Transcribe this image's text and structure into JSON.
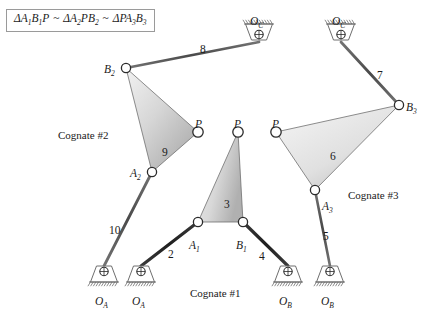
{
  "figure": {
    "formula": {
      "parts": [
        {
          "delta": "Δ",
          "text": "A",
          "sub": "1",
          "text2": "B",
          "sub2": "1",
          "text3": "P"
        },
        {
          "delta": "Δ",
          "text": "A",
          "sub": "2",
          "text2": "P",
          "sub2": "",
          "text3": "B",
          "sub3": "2"
        },
        {
          "delta": "Δ",
          "text": "P",
          "sub": "",
          "text2": "A",
          "sub2": "3",
          "text3": "B",
          "sub3": "3"
        }
      ],
      "similar_symbol": "~",
      "plain": "ΔA1B1P ~ ΔA2PB2 ~ ΔPA3B3"
    },
    "colors": {
      "link_dark": "#2b2b2b",
      "link_mid": "#575757",
      "link_light": "#8c8c8c",
      "coupler_fill_light": "#ededed",
      "coupler_fill_dark": "#b4b4b4",
      "coupler_stroke": "#707070",
      "joint_stroke": "#2b2b2b",
      "joint_fill": "#ffffff",
      "ground_stroke": "#6e6e6e",
      "text": "#1a1a1a",
      "box_border": "#9a9a9a"
    },
    "cognates": [
      {
        "name": "cognate-1",
        "label": "Cognate #1",
        "x": 190,
        "y": 288
      },
      {
        "name": "cognate-2",
        "label": "Cognate #2",
        "x": 58,
        "y": 130
      },
      {
        "name": "cognate-3",
        "label": "Cognate #3",
        "x": 348,
        "y": 190
      }
    ],
    "joints": [
      {
        "name": "A1",
        "base": "A",
        "sub": "1",
        "x": 198,
        "y": 222,
        "lx": 189,
        "ly": 240,
        "r": 4.6
      },
      {
        "name": "B1",
        "base": "B",
        "sub": "1",
        "x": 243,
        "y": 222,
        "lx": 236,
        "ly": 240,
        "r": 4.6
      },
      {
        "name": "P1",
        "base": "P",
        "sub": "",
        "x": 238,
        "y": 132,
        "lx": 234,
        "ly": 119,
        "r": 5.2
      },
      {
        "name": "A2",
        "base": "A",
        "sub": "2",
        "x": 152,
        "y": 172,
        "lx": 130,
        "ly": 168,
        "r": 4.6
      },
      {
        "name": "B2",
        "base": "B",
        "sub": "2",
        "x": 126,
        "y": 68,
        "lx": 104,
        "ly": 64,
        "r": 4.6
      },
      {
        "name": "P2",
        "base": "P",
        "sub": "",
        "x": 198,
        "y": 132,
        "lx": 195,
        "ly": 119,
        "r": 5.2
      },
      {
        "name": "A3",
        "base": "A",
        "sub": "3",
        "x": 315,
        "y": 190,
        "lx": 322,
        "ly": 201,
        "r": 4.6
      },
      {
        "name": "B3",
        "base": "B",
        "sub": "3",
        "x": 399,
        "y": 105,
        "lx": 406,
        "ly": 102,
        "r": 4.6
      },
      {
        "name": "P3",
        "base": "P",
        "sub": "",
        "x": 276,
        "y": 132,
        "lx": 272,
        "ly": 119,
        "r": 5.2
      }
    ],
    "grounds": [
      {
        "name": "OA-left",
        "base": "O",
        "sub": "A",
        "x": 104,
        "y": 266,
        "flip": false,
        "lx": 95,
        "ly": 296
      },
      {
        "name": "OA-right",
        "base": "O",
        "sub": "A",
        "x": 141,
        "y": 266,
        "flip": false,
        "lx": 132,
        "ly": 296
      },
      {
        "name": "OB-left",
        "base": "O",
        "sub": "B",
        "x": 288,
        "y": 266,
        "flip": false,
        "lx": 279,
        "ly": 296
      },
      {
        "name": "OB-right",
        "base": "O",
        "sub": "B",
        "x": 330,
        "y": 266,
        "flip": false,
        "lx": 321,
        "ly": 296
      },
      {
        "name": "OC-left",
        "base": "O",
        "sub": "C",
        "x": 259,
        "y": 40,
        "flip": true,
        "lx": 250,
        "ly": 16
      },
      {
        "name": "OC-right",
        "base": "O",
        "sub": "C",
        "x": 341,
        "y": 40,
        "flip": true,
        "lx": 332,
        "ly": 16
      }
    ],
    "links": [
      {
        "name": "link-2",
        "label": "2",
        "from": "OA-right",
        "to": "A1",
        "x1": 141,
        "y1": 266,
        "x2": 198,
        "y2": 222,
        "width": 3.2,
        "shade": "dark",
        "lx": 168,
        "ly": 249
      },
      {
        "name": "link-4",
        "label": "4",
        "from": "B1",
        "to": "OB-left",
        "x1": 243,
        "y1": 222,
        "x2": 288,
        "y2": 266,
        "width": 3.2,
        "shade": "dark",
        "lx": 259,
        "ly": 251
      },
      {
        "name": "link-5",
        "label": "5",
        "from": "A3",
        "to": "OB-right",
        "x1": 315,
        "y1": 190,
        "x2": 330,
        "y2": 266,
        "width": 2.6,
        "shade": "mid",
        "lx": 323,
        "ly": 231
      },
      {
        "name": "link-7",
        "label": "7",
        "from": "OC-right",
        "to": "B3",
        "x1": 341,
        "y1": 42,
        "x2": 399,
        "y2": 105,
        "width": 2.8,
        "shade": "mid",
        "lx": 377,
        "ly": 70
      },
      {
        "name": "link-8",
        "label": "8",
        "from": "B2",
        "to": "OC-left",
        "x1": 126,
        "y1": 68,
        "x2": 259,
        "y2": 42,
        "width": 2.8,
        "shade": "mid",
        "lx": 200,
        "ly": 44
      },
      {
        "name": "link-10",
        "label": "10",
        "from": "A2",
        "to": "OA-left",
        "x1": 152,
        "y1": 172,
        "x2": 104,
        "y2": 266,
        "width": 2.8,
        "shade": "mid",
        "lx": 109,
        "ly": 225
      }
    ],
    "couplers": [
      {
        "name": "coupler-3",
        "label": "3",
        "lx": 224,
        "ly": 199,
        "points": "238,132 243,222 198,222",
        "grad": "g3"
      },
      {
        "name": "coupler-9",
        "label": "9",
        "lx": 162,
        "ly": 147,
        "points": "126,68 198,132 152,172",
        "grad": "g9"
      },
      {
        "name": "coupler-6",
        "label": "6",
        "lx": 330,
        "ly": 151,
        "points": "276,132 399,105 315,190",
        "grad": "g6"
      }
    ]
  }
}
